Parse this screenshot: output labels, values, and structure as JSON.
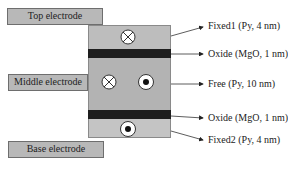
{
  "electrodes": {
    "top": "Top electrode",
    "middle": "Middle electrode",
    "base": "Base electrode"
  },
  "layers": [
    {
      "name": "Fixed1",
      "label": "Fixed1 (Py, 4 nm)",
      "magnetization": [
        "into-page"
      ]
    },
    {
      "name": "Oxide",
      "label": "Oxide (MgO, 1 nm)"
    },
    {
      "name": "Free",
      "label": "Free (Py, 10 nm)",
      "magnetization": [
        "into-page",
        "out-of-page"
      ]
    },
    {
      "name": "Oxide",
      "label": "Oxide (MgO, 1 nm)"
    },
    {
      "name": "Fixed2",
      "label": "Fixed2 (Py, 4 nm)",
      "magnetization": [
        "out-of-page"
      ]
    }
  ],
  "colors": {
    "layer_fill": "#bdbdbd",
    "oxide_fill": "#1e1e1e",
    "electrode_fill": "#b8b8b8"
  }
}
